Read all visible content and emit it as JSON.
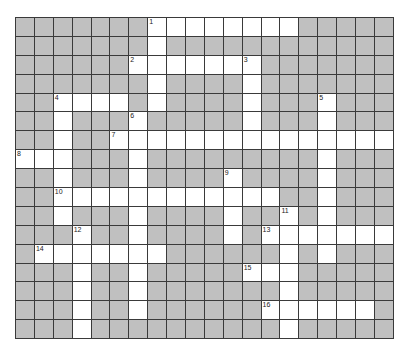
{
  "puzzle": {
    "cols": 20,
    "rows": 17,
    "colors": {
      "block": "#c0c0c0",
      "open": "#ffffff",
      "line": "#3a3a3a"
    },
    "open_cells": [
      [
        7,
        8,
        9,
        10,
        11,
        12,
        13,
        14
      ],
      [
        7
      ],
      [
        6,
        7,
        8,
        9,
        10,
        11,
        12
      ],
      [
        7,
        12
      ],
      [
        2,
        3,
        4,
        5,
        7,
        12,
        16
      ],
      [
        2,
        6,
        12,
        16
      ],
      [
        2,
        5,
        6,
        7,
        8,
        9,
        10,
        11,
        12,
        13,
        14,
        15,
        16,
        17,
        18,
        19
      ],
      [
        0,
        1,
        2,
        6,
        16
      ],
      [
        2,
        6,
        11,
        16
      ],
      [
        2,
        3,
        4,
        5,
        6,
        7,
        8,
        9,
        10,
        11,
        12,
        13,
        16
      ],
      [
        2,
        6,
        11,
        14,
        16
      ],
      [
        3,
        6,
        11,
        13,
        14,
        15,
        16,
        17,
        18,
        19
      ],
      [
        1,
        2,
        3,
        4,
        5,
        6,
        7,
        14,
        16
      ],
      [
        3,
        6,
        12,
        13,
        14
      ],
      [
        3,
        6,
        14
      ],
      [
        3,
        6,
        13,
        14,
        15,
        16,
        17,
        18
      ],
      [
        3,
        14
      ]
    ],
    "clue_numbers": [
      {
        "n": "1",
        "r": 0,
        "c": 7
      },
      {
        "n": "2",
        "r": 2,
        "c": 6
      },
      {
        "n": "3",
        "r": 2,
        "c": 12
      },
      {
        "n": "4",
        "r": 4,
        "c": 2
      },
      {
        "n": "5",
        "r": 4,
        "c": 16
      },
      {
        "n": "6",
        "r": 5,
        "c": 6
      },
      {
        "n": "7",
        "r": 6,
        "c": 5
      },
      {
        "n": "8",
        "r": 7,
        "c": 0
      },
      {
        "n": "9",
        "r": 8,
        "c": 11
      },
      {
        "n": "10",
        "r": 9,
        "c": 2
      },
      {
        "n": "11",
        "r": 10,
        "c": 14
      },
      {
        "n": "12",
        "r": 11,
        "c": 3
      },
      {
        "n": "13",
        "r": 11,
        "c": 13
      },
      {
        "n": "14",
        "r": 12,
        "c": 1
      },
      {
        "n": "15",
        "r": 13,
        "c": 12
      },
      {
        "n": "16",
        "r": 15,
        "c": 13
      }
    ]
  }
}
